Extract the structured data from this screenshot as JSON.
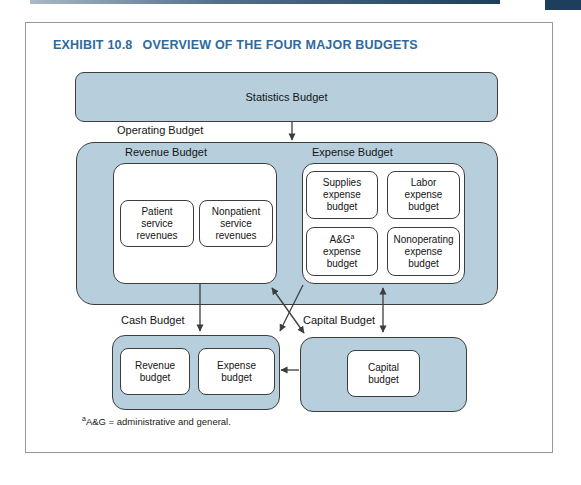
{
  "header": {
    "exhibit_label": "EXHIBIT 10.8",
    "exhibit_title": "OVERVIEW OF THE FOUR MAJOR BUDGETS"
  },
  "colors": {
    "box_fill": "#b7cedd",
    "box_border": "#3d3d3d",
    "title_blue": "#2f6a9e",
    "header_bar_dark": "#1d3e5d"
  },
  "diagram": {
    "statistics_label": "Statistics Budget",
    "operating_label": "Operating Budget",
    "revenue_group_label": "Revenue Budget",
    "expense_group_label": "Expense Budget",
    "cash_group_label": "Cash Budget",
    "capital_group_label": "Capital Budget",
    "revenue_items": [
      {
        "lines": [
          "Patient",
          "service",
          "revenues"
        ]
      },
      {
        "lines": [
          "Nonpatient",
          "service",
          "revenues"
        ]
      }
    ],
    "expense_items": [
      {
        "lines": [
          "Supplies",
          "expense",
          "budget"
        ]
      },
      {
        "lines": [
          "Labor",
          "expense",
          "budget"
        ]
      },
      {
        "lines": [
          "A&G",
          "expense",
          "budget"
        ],
        "footnote_ref": "a"
      },
      {
        "lines": [
          "Nonoperating",
          "expense",
          "budget"
        ]
      }
    ],
    "cash_items": [
      {
        "lines": [
          "Revenue",
          "budget"
        ]
      },
      {
        "lines": [
          "Expense",
          "budget"
        ]
      }
    ],
    "capital_item": {
      "lines": [
        "Capital",
        "budget"
      ]
    }
  },
  "footnote": {
    "marker": "a",
    "text": "A&G = administrative and general."
  }
}
